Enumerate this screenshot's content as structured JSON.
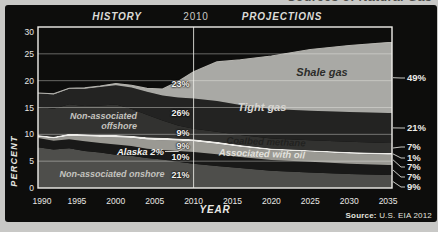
{
  "clipped_title": "Sources of Natural Gas",
  "header": {
    "history": "HISTORY",
    "year": "2010",
    "projections": "PROJECTIONS"
  },
  "source": {
    "prefix": "Source:",
    "text": " U.S. EIA 2012"
  },
  "labels": {
    "offshore_line1": "Non-associated",
    "offshore_line2": "offshore",
    "alaska": "Alaska 2%",
    "onshore": "Non-associated onshore",
    "shale": "Shale gas",
    "tight": "Tight gas",
    "coalbed": "Coalbed methane",
    "oil": "Associated with oil",
    "pct_2010": [
      "23%",
      "26%",
      "9%",
      "9%",
      "10%",
      "21%"
    ],
    "pct_2035": [
      "49%",
      "21%",
      "7%",
      "1%",
      "7%",
      "7%",
      "9%"
    ]
  },
  "colors": {
    "outer_bg": "#c8c8c6",
    "panel_bg": "#0d0d0c",
    "frame": "#efeeea",
    "grid": "rgba(240,240,235,0.5)",
    "divider": "rgba(235,235,230,0.85)",
    "top_line": "#b4b3ae",
    "leader": "#dddcd8"
  },
  "chart_data": {
    "type": "area",
    "stacked": true,
    "title": "Sources of Natural Gas",
    "xlabel": "YEAR",
    "ylabel": "PERCENT",
    "x_range": [
      1990,
      2035
    ],
    "y_range": [
      0,
      30
    ],
    "x_ticks": [
      1990,
      1995,
      2000,
      2005,
      2010,
      2015,
      2020,
      2025,
      2030,
      2035
    ],
    "y_ticks": [
      30,
      25,
      20,
      15,
      10,
      5,
      0
    ],
    "divider_year": 2010,
    "sections": {
      "left": "HISTORY",
      "right": "PROJECTIONS"
    },
    "x": [
      1990,
      1992,
      1994,
      1996,
      1998,
      2000,
      2002,
      2004,
      2006,
      2008,
      2010,
      2013,
      2016,
      2020,
      2025,
      2030,
      2035
    ],
    "series": [
      {
        "name": "Non-associated onshore",
        "share_2010": "21%",
        "share_2035": "9%",
        "color": "#4e4e4b",
        "values": [
          7.6,
          7.2,
          7.4,
          6.9,
          6.6,
          6.2,
          6.0,
          5.6,
          5.3,
          4.9,
          4.5,
          4.1,
          3.7,
          3.2,
          2.9,
          2.6,
          2.4
        ]
      },
      {
        "name": "Associated with oil",
        "share_2010": "10%",
        "share_2035": "7%",
        "color": "#191918",
        "values": [
          1.7,
          1.6,
          1.7,
          1.8,
          1.8,
          1.9,
          1.8,
          1.7,
          1.8,
          2.0,
          2.2,
          2.2,
          2.1,
          2.0,
          2.0,
          1.9,
          1.9
        ]
      },
      {
        "name": "Coalbed methane",
        "share_2010": "9%",
        "share_2035": "7%",
        "color": "#9a9993",
        "values": [
          0.2,
          0.4,
          0.6,
          0.9,
          1.1,
          1.3,
          1.5,
          1.7,
          1.8,
          1.9,
          1.95,
          1.9,
          1.85,
          1.85,
          1.85,
          1.9,
          1.9
        ]
      },
      {
        "name": "Alaska",
        "share_2010": "2%",
        "share_2035": "1%",
        "color": "#edece8",
        "values": [
          0.35,
          0.35,
          0.4,
          0.4,
          0.4,
          0.45,
          0.45,
          0.45,
          0.45,
          0.45,
          0.45,
          0.4,
          0.35,
          0.3,
          0.3,
          0.3,
          0.3
        ]
      },
      {
        "name": "Non-associated offshore",
        "share_2010": "9%",
        "share_2035": "7%",
        "color": "#323230",
        "values": [
          5.3,
          5.2,
          5.5,
          5.3,
          5.5,
          5.7,
          5.0,
          4.2,
          3.2,
          2.4,
          1.95,
          1.9,
          1.85,
          1.85,
          1.85,
          1.9,
          1.9
        ]
      },
      {
        "name": "Tight gas",
        "share_2010": "26%",
        "share_2035": "21%",
        "color": "#232322",
        "values": [
          2.5,
          2.7,
          2.9,
          3.2,
          3.4,
          3.6,
          4.0,
          4.3,
          4.7,
          5.2,
          5.6,
          5.7,
          5.6,
          5.5,
          5.5,
          5.55,
          5.6
        ]
      },
      {
        "name": "Shale gas",
        "share_2010": "23%",
        "share_2035": "49%",
        "color": "#a9a9a5",
        "values": [
          0.05,
          0.1,
          0.1,
          0.15,
          0.2,
          0.3,
          0.4,
          0.6,
          1.2,
          3.0,
          5.0,
          7.3,
          8.45,
          9.9,
          11.4,
          12.4,
          13.1
        ]
      }
    ],
    "legend_position": "in-plot",
    "grid": true
  }
}
